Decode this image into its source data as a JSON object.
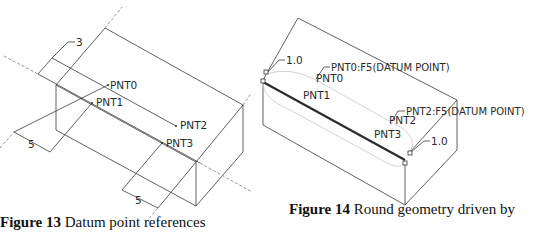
{
  "figures": [
    {
      "id": "figure-13",
      "caption": {
        "number": "Figure 13",
        "text": "Datum point references"
      },
      "labels": {
        "pnt0": "PNT0",
        "pnt1": "PNT1",
        "pnt2": "PNT2",
        "pnt3": "PNT3",
        "dim_top": "3",
        "dim_left": "5",
        "dim_bottom": "5"
      }
    },
    {
      "id": "figure-14",
      "caption": {
        "number": "Figure 14",
        "text": "Round geometry driven by"
      },
      "labels": {
        "pnt0_full": "PNT0:F5(DATUM POINT)",
        "pnt0": "PNT0",
        "pnt1": "PNT1",
        "pnt2_full": "PNT2:F5(DATUM POINT)",
        "pnt2": "PNT2",
        "pnt3": "PNT3",
        "radius_top": "1.0",
        "radius_bottom": "1.0"
      }
    }
  ],
  "colors": {
    "line": "#3a3a3a",
    "dashed": "#777777",
    "thick_edge": "#2b2b2b",
    "ghost": "#c8c8c8"
  }
}
